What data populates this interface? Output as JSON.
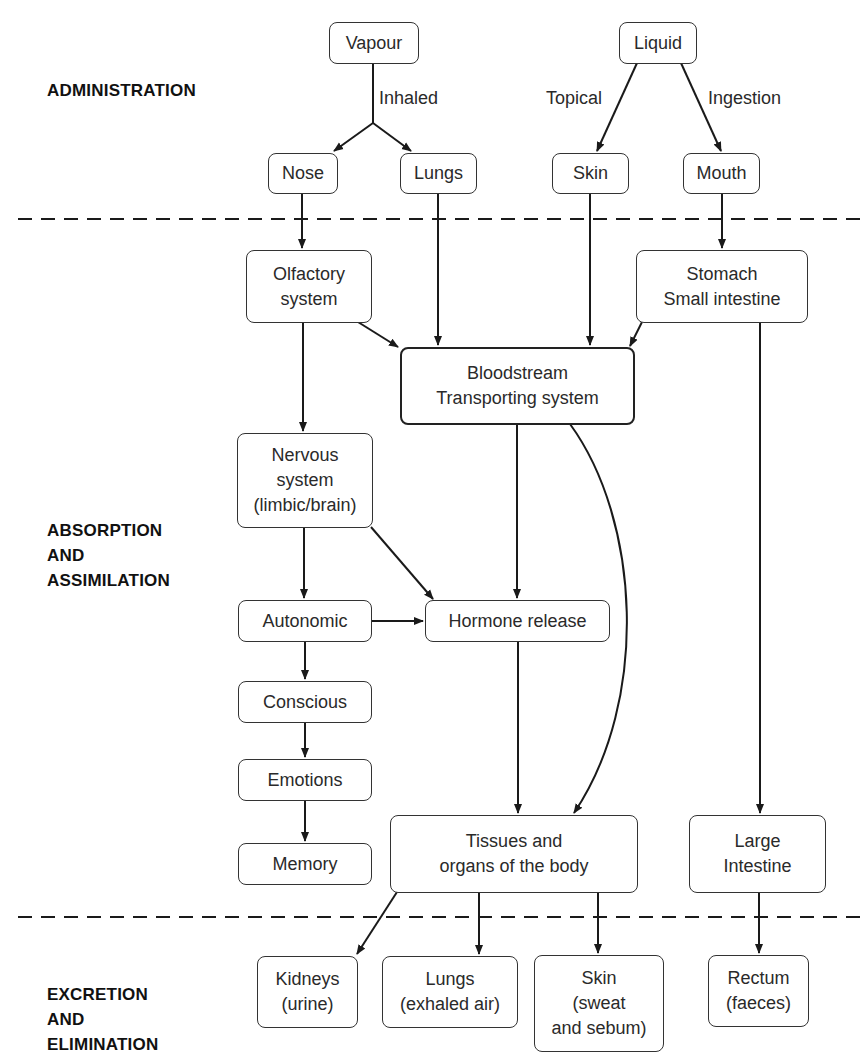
{
  "sections": {
    "administration": {
      "lines": [
        "ADMINISTRATION"
      ]
    },
    "absorption": {
      "lines": [
        "ABSORPTION",
        "AND",
        "ASSIMILATION"
      ]
    },
    "excretion": {
      "lines": [
        "EXCRETION",
        "AND",
        "ELIMINATION"
      ]
    }
  },
  "edge_labels": {
    "inhaled": "Inhaled",
    "topical": "Topical",
    "ingestion": "Ingestion"
  },
  "nodes": {
    "vapour": {
      "lines": [
        "Vapour"
      ]
    },
    "liquid": {
      "lines": [
        "Liquid"
      ]
    },
    "nose": {
      "lines": [
        "Nose"
      ]
    },
    "lungs_in": {
      "lines": [
        "Lungs"
      ]
    },
    "skin_in": {
      "lines": [
        "Skin"
      ]
    },
    "mouth": {
      "lines": [
        "Mouth"
      ]
    },
    "olfactory": {
      "lines": [
        "Olfactory",
        "system"
      ]
    },
    "stomach": {
      "lines": [
        "Stomach",
        "Small intestine"
      ]
    },
    "bloodstream": {
      "lines": [
        "Bloodstream",
        "Transporting system"
      ]
    },
    "nervous": {
      "lines": [
        "Nervous",
        "system",
        "(limbic/brain)"
      ]
    },
    "autonomic": {
      "lines": [
        "Autonomic"
      ]
    },
    "hormone": {
      "lines": [
        "Hormone release"
      ]
    },
    "conscious": {
      "lines": [
        "Conscious"
      ]
    },
    "emotions": {
      "lines": [
        "Emotions"
      ]
    },
    "memory": {
      "lines": [
        "Memory"
      ]
    },
    "tissues": {
      "lines": [
        "Tissues and",
        "organs of the body"
      ]
    },
    "large_intestine": {
      "lines": [
        "Large",
        "Intestine"
      ]
    },
    "kidneys": {
      "lines": [
        "Kidneys",
        "(urine)"
      ]
    },
    "lungs_out": {
      "lines": [
        "Lungs",
        "(exhaled air)"
      ]
    },
    "skin_out": {
      "lines": [
        "Skin",
        "(sweat",
        "and sebum)"
      ]
    },
    "rectum": {
      "lines": [
        "Rectum",
        "(faeces)"
      ]
    }
  },
  "edges": [
    {
      "from": "vapour",
      "to": "nose",
      "label": "Inhaled"
    },
    {
      "from": "vapour",
      "to": "lungs_in",
      "label": "Inhaled"
    },
    {
      "from": "liquid",
      "to": "skin_in",
      "label": "Topical"
    },
    {
      "from": "liquid",
      "to": "mouth",
      "label": "Ingestion"
    },
    {
      "from": "nose",
      "to": "olfactory"
    },
    {
      "from": "lungs_in",
      "to": "bloodstream"
    },
    {
      "from": "skin_in",
      "to": "bloodstream"
    },
    {
      "from": "mouth",
      "to": "stomach"
    },
    {
      "from": "olfactory",
      "to": "bloodstream"
    },
    {
      "from": "stomach",
      "to": "bloodstream"
    },
    {
      "from": "olfactory",
      "to": "nervous"
    },
    {
      "from": "stomach",
      "to": "large_intestine"
    },
    {
      "from": "bloodstream",
      "to": "hormone"
    },
    {
      "from": "bloodstream",
      "to": "tissues"
    },
    {
      "from": "nervous",
      "to": "autonomic"
    },
    {
      "from": "nervous",
      "to": "hormone"
    },
    {
      "from": "autonomic",
      "to": "hormone"
    },
    {
      "from": "autonomic",
      "to": "conscious"
    },
    {
      "from": "conscious",
      "to": "emotions"
    },
    {
      "from": "emotions",
      "to": "memory"
    },
    {
      "from": "hormone",
      "to": "tissues"
    },
    {
      "from": "tissues",
      "to": "kidneys"
    },
    {
      "from": "tissues",
      "to": "lungs_out"
    },
    {
      "from": "tissues",
      "to": "skin_out"
    },
    {
      "from": "large_intestine",
      "to": "rectum"
    }
  ],
  "colors": {
    "line": "#1a1a1a",
    "box_border": "#333333",
    "background": "#ffffff"
  }
}
